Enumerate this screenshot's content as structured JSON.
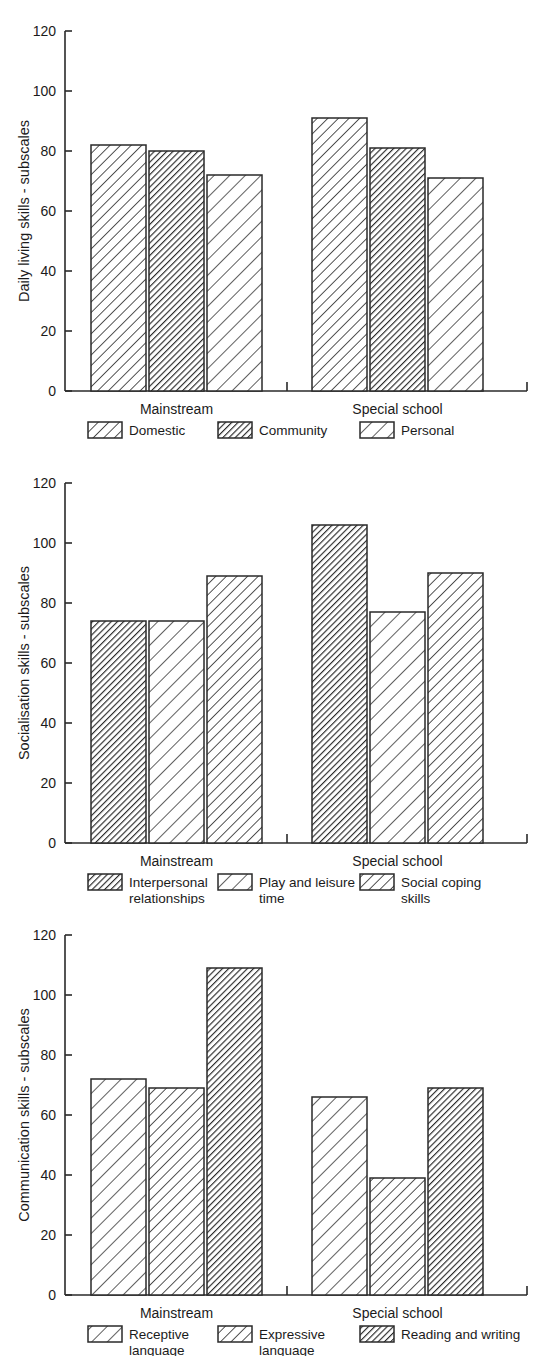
{
  "figure": {
    "width": 549,
    "height": 1357,
    "background": "#ffffff",
    "ink_color": "#2a2a2a",
    "text_color": "#1b1b1b"
  },
  "charts": [
    {
      "id": "daily-living-skills",
      "chart_data": {
        "type": "bar",
        "title": "",
        "xlabel": "",
        "ylabel": "Daily living skills - subscales",
        "categories": [
          "Mainstream",
          "Special school"
        ],
        "ylim": [
          0,
          120
        ],
        "yticks": [
          0,
          20,
          40,
          60,
          80,
          100,
          120
        ],
        "ytick_labels": [
          "0",
          "20",
          "40",
          "60",
          "80",
          "100",
          "120"
        ],
        "grid": false,
        "legend_position": "bottom",
        "series": [
          {
            "name": "Domestic",
            "hatch": "medium",
            "values": [
              82,
              91
            ]
          },
          {
            "name": "Community",
            "hatch": "dense",
            "values": [
              80,
              81
            ]
          },
          {
            "name": "Personal",
            "hatch": "sparse",
            "values": [
              72,
              71
            ]
          }
        ]
      }
    },
    {
      "id": "socialisation-skills",
      "chart_data": {
        "type": "bar",
        "title": "",
        "xlabel": "",
        "ylabel": "Socialisation skills - subscales",
        "categories": [
          "Mainstream",
          "Special school"
        ],
        "ylim": [
          0,
          120
        ],
        "yticks": [
          0,
          20,
          40,
          60,
          80,
          100,
          120
        ],
        "ytick_labels": [
          "0",
          "20",
          "40",
          "60",
          "80",
          "100",
          "120"
        ],
        "grid": false,
        "legend_position": "bottom",
        "series": [
          {
            "name": "Interpersonal relationships",
            "hatch": "dense",
            "values": [
              74,
              106
            ]
          },
          {
            "name": "Play and leisure time",
            "hatch": "sparse",
            "values": [
              74,
              77
            ]
          },
          {
            "name": "Social coping skills",
            "hatch": "medium",
            "values": [
              89,
              90
            ]
          }
        ]
      }
    },
    {
      "id": "communication-skills",
      "chart_data": {
        "type": "bar",
        "title": "",
        "xlabel": "",
        "ylabel": "Communication skills - subscales",
        "categories": [
          "Mainstream",
          "Special school"
        ],
        "ylim": [
          0,
          120
        ],
        "yticks": [
          0,
          20,
          40,
          60,
          80,
          100,
          120
        ],
        "ytick_labels": [
          "0",
          "20",
          "40",
          "60",
          "80",
          "100",
          "120"
        ],
        "grid": false,
        "legend_position": "bottom",
        "series": [
          {
            "name": "Receptive language",
            "hatch": "sparse",
            "values": [
              72,
              66
            ]
          },
          {
            "name": "Expressive language",
            "hatch": "medium",
            "values": [
              69,
              39
            ]
          },
          {
            "name": "Reading and writing",
            "hatch": "dense",
            "values": [
              109,
              69
            ]
          }
        ]
      }
    }
  ],
  "legends": [
    {
      "items": [
        {
          "label": "Domestic",
          "label_line2": "",
          "hatch": "medium"
        },
        {
          "label": "Community",
          "label_line2": "",
          "hatch": "dense"
        },
        {
          "label": "Personal",
          "label_line2": "",
          "hatch": "sparse"
        }
      ]
    },
    {
      "items": [
        {
          "label": "Interpersonal",
          "label_line2": "relationships",
          "hatch": "dense"
        },
        {
          "label": "Play and leisure",
          "label_line2": "time",
          "hatch": "sparse"
        },
        {
          "label": "Social coping",
          "label_line2": "skills",
          "hatch": "medium"
        }
      ]
    },
    {
      "items": [
        {
          "label": "Receptive",
          "label_line2": "language",
          "hatch": "sparse"
        },
        {
          "label": "Expressive",
          "label_line2": "language",
          "hatch": "medium"
        },
        {
          "label": "Reading and writing",
          "label_line2": "",
          "hatch": "dense"
        }
      ]
    }
  ]
}
